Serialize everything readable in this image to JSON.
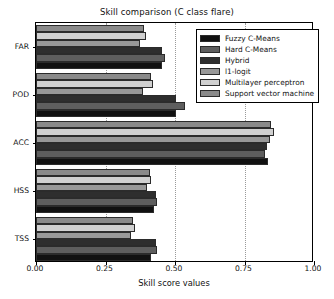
{
  "chart_data": {
    "type": "bar",
    "orientation": "horizontal",
    "title": "Skill comparison (C class flare)",
    "xlabel": "Skill score values",
    "ylabel": "",
    "xlim": [
      0.0,
      1.0
    ],
    "xticks": [
      0.0,
      0.25,
      0.5,
      0.75,
      1.0
    ],
    "xtick_labels": [
      "0.00",
      "0.25",
      "0.50",
      "0.75",
      "1.00"
    ],
    "grid": true,
    "grid_axis": "x",
    "grid_style": "dotted",
    "legend_position": "upper right",
    "categories": [
      "FAR",
      "POD",
      "ACC",
      "HSS",
      "TSS"
    ],
    "series": [
      {
        "name": "Fuzzy C-Means",
        "color": "#111111",
        "values": [
          0.455,
          0.505,
          0.835,
          0.425,
          0.415
        ]
      },
      {
        "name": "Hard C-Means",
        "color": "#5e5e5e",
        "values": [
          0.465,
          0.535,
          0.825,
          0.435,
          0.435
        ]
      },
      {
        "name": "Hybrid",
        "color": "#2e2e2e",
        "values": [
          0.455,
          0.505,
          0.83,
          0.43,
          0.43
        ]
      },
      {
        "name": "l1-logit",
        "color": "#989898",
        "values": [
          0.375,
          0.385,
          0.84,
          0.4,
          0.34
        ]
      },
      {
        "name": "Multilayer perceptron",
        "color": "#d0d0d0",
        "values": [
          0.395,
          0.42,
          0.855,
          0.415,
          0.355
        ]
      },
      {
        "name": "Support vector machine",
        "color": "#8a8a8a",
        "values": [
          0.39,
          0.415,
          0.845,
          0.41,
          0.35
        ]
      }
    ]
  },
  "axes": {
    "x_title": "Skill score values",
    "tick_labels_x": [
      "0.00",
      "0.25",
      "0.50",
      "0.75",
      "1.00"
    ],
    "tick_labels_y": [
      "FAR",
      "POD",
      "ACC",
      "HSS",
      "TSS"
    ]
  },
  "legend": {
    "entries": [
      {
        "label": "Fuzzy C-Means",
        "color": "#111111"
      },
      {
        "label": "Hard C-Means",
        "color": "#5e5e5e"
      },
      {
        "label": "Hybrid",
        "color": "#2e2e2e"
      },
      {
        "label": "l1-logit",
        "color": "#989898"
      },
      {
        "label": "Multilayer perceptron",
        "color": "#d0d0d0"
      },
      {
        "label": "Support vector machine",
        "color": "#8a8a8a"
      }
    ]
  },
  "style": {
    "background": "#ffffff",
    "axis_color": "#000000",
    "grid_color": "#9a9a9a",
    "bar_edge_color": "#2b2b2b"
  }
}
